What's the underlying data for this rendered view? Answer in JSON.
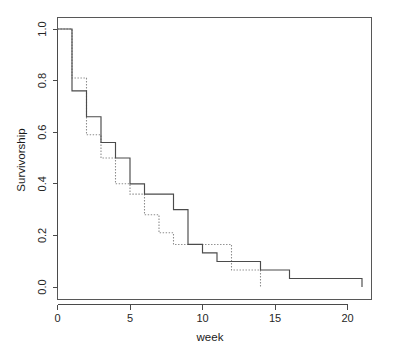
{
  "chart_data": {
    "type": "line",
    "subtype": "kaplan-meier-step",
    "title": "",
    "xlabel": "week",
    "ylabel": "Survivorship",
    "xlim": [
      0,
      22.2
    ],
    "ylim": [
      0.0,
      1.04
    ],
    "xticks": [
      0,
      5,
      10,
      15,
      20
    ],
    "xtick_labels": [
      "0",
      "5",
      "10",
      "15",
      "20"
    ],
    "yticks": [
      0.0,
      0.2,
      0.4,
      0.6,
      0.8,
      1.0
    ],
    "ytick_labels": [
      "0.0",
      "0.2",
      "0.4",
      "0.6",
      "0.8",
      "1.0"
    ],
    "grid": false,
    "legend": "none",
    "box": true,
    "series": [
      {
        "name": "group-1-solid",
        "style": "solid",
        "color": "#4b4b4b",
        "x": [
          0,
          1,
          2,
          3,
          4,
          5,
          6,
          8,
          9,
          10,
          11,
          12,
          14,
          16,
          21,
          21
        ],
        "y": [
          1.0,
          0.76,
          0.66,
          0.56,
          0.5,
          0.4,
          0.36,
          0.3,
          0.165,
          0.132,
          0.099,
          0.099,
          0.066,
          0.033,
          0.033,
          0.0
        ]
      },
      {
        "name": "group-2-dotted",
        "style": "dotted",
        "color": "#8d8d8d",
        "x": [
          0,
          1,
          2,
          3,
          4,
          5,
          6,
          7,
          8,
          9,
          12,
          14,
          14
        ],
        "y": [
          1.0,
          0.81,
          0.59,
          0.5,
          0.4,
          0.36,
          0.28,
          0.21,
          0.165,
          0.165,
          0.066,
          0.066,
          0.0
        ]
      }
    ]
  },
  "axes": {
    "x_title": "week",
    "y_title": "Survivorship",
    "x_tick_0": "0",
    "x_tick_1": "5",
    "x_tick_2": "10",
    "x_tick_3": "15",
    "x_tick_4": "20",
    "y_tick_0": "0.0",
    "y_tick_1": "0.2",
    "y_tick_2": "0.4",
    "y_tick_3": "0.6",
    "y_tick_4": "0.8",
    "y_tick_5": "1.0"
  },
  "colors": {
    "axis": "#4a4a4a",
    "box": "#575757",
    "solid_curve": "#4b4b4b",
    "dotted_curve": "#8d8d8d",
    "background": "#ffffff",
    "text": "#1a1a1a"
  }
}
